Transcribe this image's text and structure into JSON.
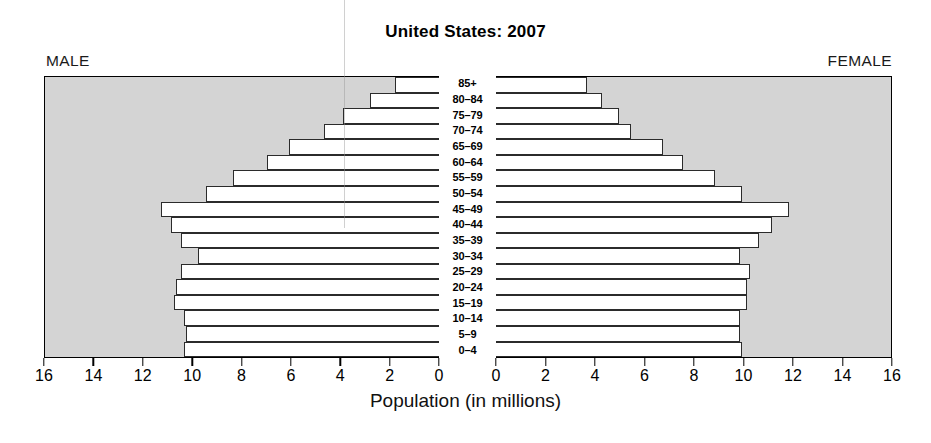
{
  "title": "United States: 2007",
  "labels": {
    "male": "MALE",
    "female": "FEMALE",
    "axis_caption": "Population (in millions)"
  },
  "colors": {
    "panel_background": "#d4d4d4",
    "bar_fill": "#ffffff",
    "bar_stroke": "#2b2b2b",
    "text": "#000000"
  },
  "chart_data": {
    "type": "bar",
    "subtype": "population-pyramid",
    "title": "United States: 2007",
    "xlabel": "Population (in millions)",
    "ylabel": "",
    "grid": false,
    "legend": "none",
    "xlim_left": [
      16,
      0
    ],
    "xlim_right": [
      0,
      16
    ],
    "left_ticks": [
      16,
      14,
      12,
      10,
      8,
      6,
      4,
      2,
      0
    ],
    "right_ticks": [
      0,
      2,
      4,
      6,
      8,
      10,
      12,
      14,
      16
    ],
    "categories": [
      "85+",
      "80–84",
      "75–79",
      "70–74",
      "65–69",
      "60–64",
      "55–59",
      "50–54",
      "45–49",
      "40–44",
      "35–39",
      "30–34",
      "25–29",
      "20–24",
      "15–19",
      "10–14",
      "5–9",
      "0–4"
    ],
    "series": [
      {
        "name": "MALE",
        "side": "left",
        "values": [
          1.8,
          2.8,
          3.9,
          4.7,
          6.1,
          7.0,
          8.4,
          9.5,
          11.3,
          10.9,
          10.5,
          9.8,
          10.5,
          10.7,
          10.8,
          10.4,
          10.3,
          10.4
        ]
      },
      {
        "name": "FEMALE",
        "side": "right",
        "values": [
          3.7,
          4.3,
          5.0,
          5.5,
          6.8,
          7.6,
          8.9,
          10.0,
          11.9,
          11.2,
          10.7,
          9.9,
          10.3,
          10.2,
          10.2,
          9.9,
          9.9,
          10.0
        ]
      }
    ]
  }
}
